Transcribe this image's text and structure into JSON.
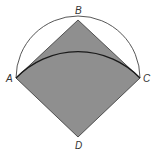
{
  "diagram": {
    "type": "geometry",
    "colors": {
      "fill": "#8f8f8f",
      "stroke": "#333333",
      "arc": "#222222",
      "background": "#ffffff"
    },
    "points": {
      "A": {
        "label": "A",
        "x": 16,
        "y": 78
      },
      "B": {
        "label": "B",
        "x": 78,
        "y": 20
      },
      "C": {
        "label": "C",
        "x": 140,
        "y": 78
      },
      "D": {
        "label": "D",
        "x": 78,
        "y": 137
      }
    },
    "labels": {
      "A": "A",
      "B": "B",
      "C": "C",
      "D": "D"
    }
  }
}
